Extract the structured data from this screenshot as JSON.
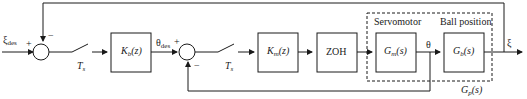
{
  "diagram": {
    "type": "control-block-diagram",
    "input": {
      "symbol": "ξ",
      "subscript": "des"
    },
    "output": {
      "symbol": "ξ"
    },
    "summing_junctions": [
      {
        "id": "outer",
        "plus": "+",
        "minus": "−"
      },
      {
        "id": "inner",
        "plus": "+",
        "minus": "−"
      }
    ],
    "samplers": [
      {
        "symbol": "T",
        "subscript": "s"
      },
      {
        "symbol": "T",
        "subscript": "s"
      }
    ],
    "blocks": [
      {
        "id": "Kb",
        "base": "K",
        "sub": "b",
        "arg": "(z)"
      },
      {
        "id": "Km",
        "base": "K",
        "sub": "m",
        "arg": "(z)"
      },
      {
        "id": "zoh",
        "label": "ZOH"
      },
      {
        "id": "Gm",
        "base": "G",
        "sub": "m",
        "arg": "(s)"
      },
      {
        "id": "Gb",
        "base": "G",
        "sub": "b",
        "arg": "(s)"
      }
    ],
    "signals": {
      "theta_des": {
        "symbol": "θ",
        "subscript": "des"
      },
      "theta": {
        "symbol": "θ"
      }
    },
    "group": {
      "servomotor_label": "Servomotor",
      "ball_position_label": "Ball position",
      "plant": {
        "base": "G",
        "sub": "p",
        "arg": "(s)"
      }
    }
  }
}
